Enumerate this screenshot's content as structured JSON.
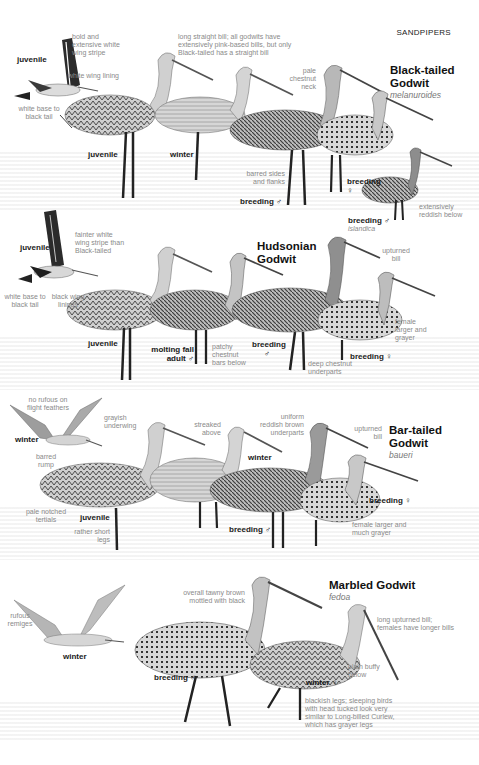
{
  "page": {
    "section_header": "SANDPIPERS"
  },
  "species": [
    {
      "name_line1": "Black-tailed",
      "name_line2": "Godwit",
      "subspecies": "melanuroides",
      "plumage_labels": {
        "flight_juvenile": "juvenile",
        "juvenile": "juvenile",
        "winter": "winter",
        "breeding_male": "breeding ♂",
        "breeding_female_line1": "breeding",
        "breeding_female_line2": "♀",
        "breeding_male_islandica": "breeding ♂",
        "islandica": "islandica"
      },
      "notes": {
        "wing_stripe": "bold and extensive white wing stripe",
        "wing_lining": "white wing lining",
        "tail_base": "white base to black tail",
        "bill": "long straight bill; all godwits have extensively pink-based bills, but only Black-tailed has a straight bill",
        "neck": "pale chestnut neck",
        "flanks": "barred sides and flanks",
        "below": "extensively reddish below"
      }
    },
    {
      "name_line1": "Hudsonian",
      "name_line2": "Godwit",
      "plumage_labels": {
        "flight_juvenile": "juvenile",
        "juvenile": "juvenile",
        "molting_line1": "molting fall",
        "molting_line2": "adult ♂",
        "breeding_male_line1": "breeding",
        "breeding_male_line2": "♂",
        "breeding_female": "breeding ♀"
      },
      "notes": {
        "wing_stripe": "fainter white wing stripe than Black-tailed",
        "tail_base": "white base to black tail",
        "wing_linings": "black wing linings",
        "bill": "upturned bill",
        "female": "female larger and grayer",
        "bars": "patchy chestnut bars below",
        "underparts": "deep chestnut underparts"
      }
    },
    {
      "name_line1": "Bar-tailed",
      "name_line2": "Godwit",
      "subspecies": "baueri",
      "plumage_labels": {
        "flight_winter": "winter",
        "juvenile": "juvenile",
        "winter": "winter",
        "breeding_male": "breeding ♂",
        "breeding_female": "breeding ♀"
      },
      "notes": {
        "flight_feathers": "no rufous on flight feathers",
        "underwing": "grayish underwing",
        "rump": "barred rump",
        "streaked": "streaked above",
        "underparts": "uniform reddish brown underparts",
        "bill": "upturned bill",
        "tertials": "pale notched tertials",
        "legs": "rather short legs",
        "female": "female larger and much grayer"
      }
    },
    {
      "name_line1": "Marbled Godwit",
      "subspecies": "fedoa",
      "plumage_labels": {
        "flight_winter": "winter",
        "breeding_male": "breeding ♂",
        "winter_female": "winter ♀"
      },
      "notes": {
        "remiges": "rufous remiges",
        "overall": "overall tawny brown mottled with black",
        "bill": "long upturned bill; females have longer bills",
        "below": "plain buffy below",
        "legs": "blackish legs; sleeping birds with head tucked look very similar to Long-billed Curlew, which has grayer legs"
      }
    }
  ]
}
